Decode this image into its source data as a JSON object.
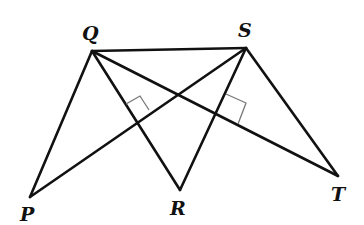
{
  "diagram": {
    "points": [
      {
        "name": "Q",
        "x": 92,
        "y": 51,
        "label_x": 82,
        "label_y": 40
      },
      {
        "name": "S",
        "x": 246,
        "y": 48,
        "label_x": 238,
        "label_y": 37
      },
      {
        "name": "P",
        "x": 30,
        "y": 197,
        "label_x": 20,
        "label_y": 221
      },
      {
        "name": "R",
        "x": 180,
        "y": 190,
        "label_x": 170,
        "label_y": 215
      },
      {
        "name": "T",
        "x": 338,
        "y": 176,
        "label_x": 331,
        "label_y": 201
      }
    ],
    "segments": [
      "QS",
      "QP",
      "QR",
      "QT",
      "SP",
      "SR",
      "ST"
    ],
    "right_angles": [
      {
        "at": "intersection of QR and SP",
        "x": 137,
        "y": 122
      },
      {
        "at": "intersection of SR and QT",
        "x": 215,
        "y": 114
      }
    ],
    "colors": {
      "line": "#111111",
      "marker": "#777777",
      "background": "#ffffff"
    }
  }
}
